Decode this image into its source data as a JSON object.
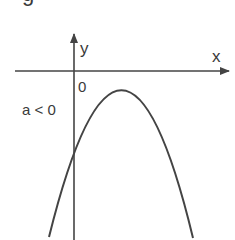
{
  "figure": {
    "caption_fragment": "g",
    "axes": {
      "x_label": "x",
      "y_label": "y",
      "origin_label": "0"
    },
    "annotation": "a < 0",
    "curve": {
      "type": "parabola",
      "opens": "downward",
      "description": "Downward-opening parabola with vertex below the x-axis (to the right of the y-axis); crosses the y-axis below the origin"
    },
    "colors": {
      "line": "#444444",
      "text": "#3a3a3a",
      "background": "#ffffff"
    }
  }
}
